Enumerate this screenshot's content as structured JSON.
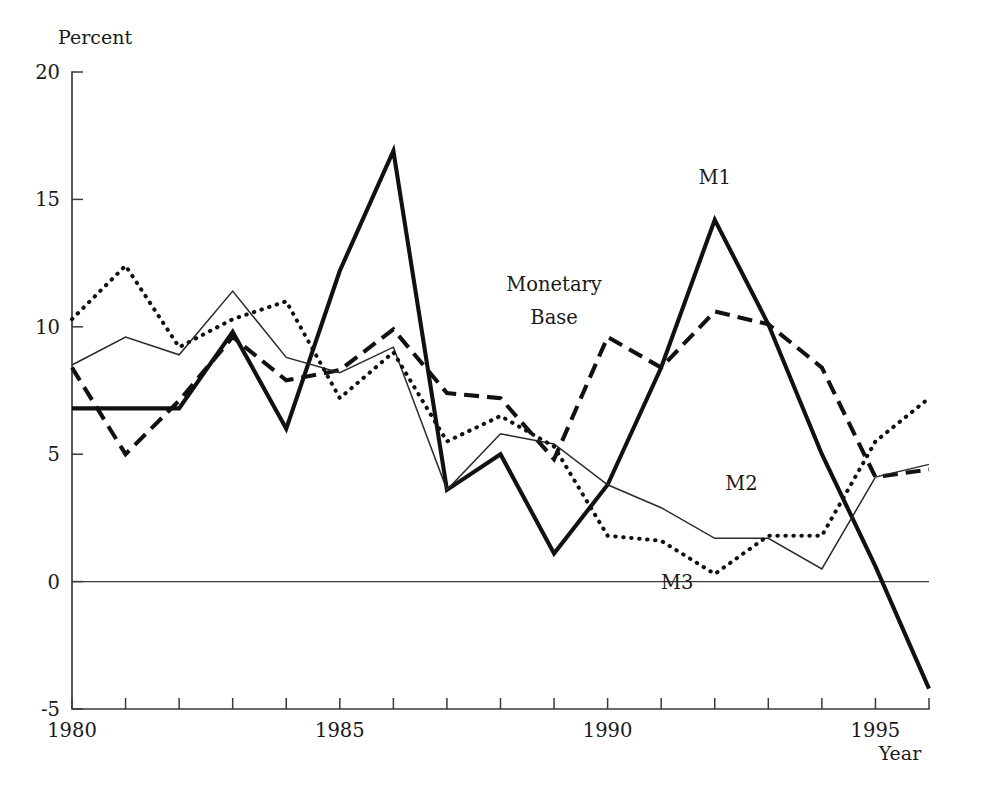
{
  "chart_data": {
    "type": "line",
    "title": "",
    "subtitle": "",
    "xlabel": "Year",
    "ylabel": "Percent",
    "xlim": [
      1980,
      1996
    ],
    "ylim": [
      -5,
      20
    ],
    "grid": false,
    "legend_position": "inline-annotations",
    "x": [
      1980,
      1981,
      1982,
      1983,
      1984,
      1985,
      1986,
      1987,
      1988,
      1989,
      1990,
      1991,
      1992,
      1993,
      1994,
      1995,
      1996
    ],
    "x_tick_labels": [
      "1980",
      "1985",
      "1990",
      "1995"
    ],
    "x_tick_values": [
      1980,
      1985,
      1990,
      1995
    ],
    "x_minor_ticks": [
      1980,
      1981,
      1982,
      1983,
      1984,
      1985,
      1986,
      1987,
      1988,
      1989,
      1990,
      1991,
      1992,
      1993,
      1994,
      1995,
      1996
    ],
    "y_tick_labels": [
      "-5",
      "0",
      "5",
      "10",
      "15",
      "20"
    ],
    "y_tick_values": [
      -5,
      0,
      5,
      10,
      15,
      20
    ],
    "series": [
      {
        "name": "M1",
        "label": "M1",
        "style": "solid-thick",
        "color": "#111111",
        "values": [
          6.8,
          6.8,
          6.8,
          9.8,
          6.0,
          12.2,
          16.9,
          3.6,
          5.0,
          1.1,
          3.8,
          8.4,
          14.2,
          10.1,
          5.0,
          0.6,
          -4.2
        ]
      },
      {
        "name": "Monetary Base",
        "label": "Monetary Base",
        "style": "dashed-thick",
        "color": "#111111",
        "values": [
          8.4,
          5.0,
          7.1,
          9.6,
          7.9,
          8.3,
          9.9,
          7.4,
          7.2,
          4.8,
          9.6,
          8.4,
          10.6,
          10.1,
          8.4,
          4.1,
          4.4
        ]
      },
      {
        "name": "M2",
        "label": "M2",
        "style": "solid-thin",
        "color": "#2a2a2a",
        "values": [
          8.5,
          9.6,
          8.9,
          11.4,
          8.8,
          8.2,
          9.2,
          3.6,
          5.8,
          5.4,
          3.8,
          2.9,
          1.7,
          1.7,
          0.5,
          4.1,
          4.6
        ]
      },
      {
        "name": "M3",
        "label": "M3",
        "style": "dotted-thick",
        "color": "#111111",
        "values": [
          10.3,
          12.4,
          9.2,
          10.3,
          11.0,
          7.2,
          9.0,
          5.5,
          6.5,
          5.3,
          1.8,
          1.6,
          0.3,
          1.8,
          1.8,
          5.5,
          7.2
        ]
      }
    ],
    "annotations": [
      {
        "text": "M1",
        "x": 1992.0,
        "y": 15.6
      },
      {
        "text": "Monetary",
        "x": 1989.0,
        "y": 11.4
      },
      {
        "text": "Base",
        "x": 1989.0,
        "y": 10.1
      },
      {
        "text": "M2",
        "x": 1992.5,
        "y": 3.6
      },
      {
        "text": "M3",
        "x": 1991.3,
        "y": -0.3
      }
    ]
  }
}
